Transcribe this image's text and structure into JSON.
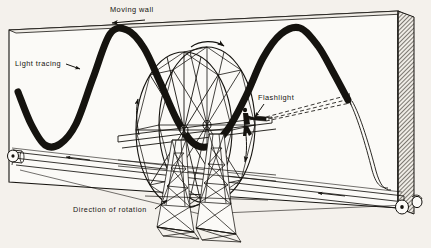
{
  "figure": {
    "type": "technical-line-illustration",
    "background_color": "#f4f1ec",
    "ink_color": "#15130f",
    "labels": {
      "moving_wall": "Moving wall",
      "light_tracing": "Light tracing",
      "flashlight": "Flashlight",
      "direction_of_rotation": "Direction of rotation"
    },
    "annotations": [
      {
        "name": "moving-wall-arrow",
        "direction": "left",
        "meaning": "wall travels to the left"
      },
      {
        "name": "wheel-top-arrow",
        "direction": "clockwise-right",
        "meaning": "top of wheel moves right"
      },
      {
        "name": "wheel-left-arrow",
        "direction": "up",
        "meaning": "left side of wheel rises"
      },
      {
        "name": "wheel-right-arrow",
        "direction": "down",
        "meaning": "right side of wheel descends"
      },
      {
        "name": "belt-arrow-upper",
        "direction": "left",
        "meaning": "upper belt run moves left"
      },
      {
        "name": "belt-arrow-lower",
        "direction": "left",
        "meaning": "lower belt run moves left"
      }
    ],
    "parts": [
      {
        "name": "moving-wall",
        "description": "large rectangular screen in perspective with shaded right edge"
      },
      {
        "name": "ferris-wheel",
        "description": "double-rim wheel with radial spokes and cross bracing"
      },
      {
        "name": "support-tower-left",
        "description": "lattice steel tower"
      },
      {
        "name": "support-tower-right",
        "description": "lattice steel tower"
      },
      {
        "name": "rider-with-flashlight",
        "description": "seated figure on wheel rim holding a flashlight"
      },
      {
        "name": "light-beam",
        "description": "dashed cone of light from flashlight to wall"
      },
      {
        "name": "sine-trace",
        "description": "thick black sinusoidal curve drawn on the wall"
      },
      {
        "name": "roller-left",
        "description": "drum at left end of wall track"
      },
      {
        "name": "roller-right-front",
        "description": "drum at right end of wall track"
      },
      {
        "name": "roller-right-back",
        "description": "second drum at right end"
      },
      {
        "name": "track-rails",
        "description": "long parallel rails carrying the moving wall"
      }
    ]
  },
  "chart_data": {
    "type": "line",
    "title": "Light tracing",
    "xlabel": "",
    "ylabel": "",
    "x": [
      18,
      31,
      45,
      60,
      76,
      93,
      110,
      127,
      144,
      160,
      177,
      193,
      210,
      228,
      246,
      263,
      281,
      300,
      318,
      333,
      348
    ],
    "y": [
      92,
      124,
      145,
      144,
      124,
      78,
      34,
      30,
      48,
      82,
      120,
      143,
      146,
      129,
      96,
      58,
      34,
      28,
      46,
      72,
      100
    ],
    "amplitude": 59,
    "wavelength": 190,
    "grid": false,
    "legend": "none"
  }
}
